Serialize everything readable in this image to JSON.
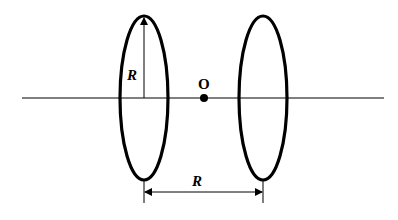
{
  "diagram": {
    "labels": {
      "radius": "R",
      "separation": "R",
      "midpoint": "O"
    },
    "colors": {
      "stroke": "#000000",
      "background": "#ffffff"
    }
  }
}
